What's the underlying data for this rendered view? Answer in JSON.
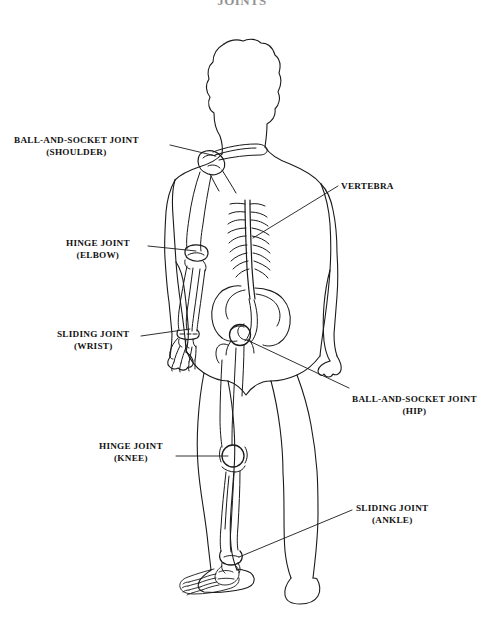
{
  "title": "JOINTS",
  "colors": {
    "ink": "#121212",
    "line": "#1a1a1a",
    "background": "#ffffff"
  },
  "callouts": [
    {
      "id": "shoulder",
      "joint_type": "BALL-AND-SOCKET JOINT",
      "location": "(SHOULDER)",
      "side": "left",
      "leader": {
        "x1": 170,
        "y1": 145,
        "x2": 216,
        "y2": 156
      }
    },
    {
      "id": "elbow",
      "joint_type": "HINGE JOINT",
      "location": "(ELBOW)",
      "side": "left",
      "leader": {
        "x1": 148,
        "y1": 246,
        "x2": 196,
        "y2": 251
      }
    },
    {
      "id": "wrist",
      "joint_type": "SLIDING JOINT",
      "location": "(WRIST)",
      "side": "left",
      "leader": {
        "x1": 141,
        "y1": 336,
        "x2": 190,
        "y2": 329
      }
    },
    {
      "id": "vertebra",
      "joint_type": "VERTEBRA",
      "location": "",
      "side": "right",
      "leader": {
        "x1": 338,
        "y1": 186,
        "x2": 253,
        "y2": 238
      }
    },
    {
      "id": "hip",
      "joint_type": "BALL-AND-SOCKET JOINT",
      "location": "(HIP)",
      "side": "right",
      "leader": {
        "x1": 349,
        "y1": 388,
        "x2": 247,
        "y2": 340
      }
    },
    {
      "id": "knee",
      "joint_type": "HINGE JOINT",
      "location": "(KNEE)",
      "side": "left",
      "leader": {
        "x1": 176,
        "y1": 456,
        "x2": 228,
        "y2": 456
      }
    },
    {
      "id": "ankle",
      "joint_type": "SLIDING JOINT",
      "location": "(ANKLE)",
      "side": "right",
      "leader": {
        "x1": 352,
        "y1": 510,
        "x2": 239,
        "y2": 557
      }
    }
  ]
}
